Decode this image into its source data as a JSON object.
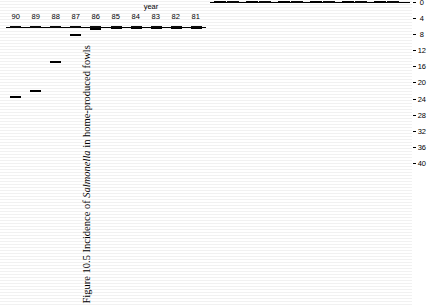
{
  "figure": {
    "caption_prefix": "Figure 10.5 Incidence of ",
    "caption_italic": "Salmonella",
    "caption_suffix": " in home-produced fowls"
  },
  "chart_data": [
    {
      "id": "incidents-by-year",
      "type": "bar",
      "orientation": "horizontal-rotated",
      "title": "",
      "xlabel": "year",
      "ylabel": "incidents",
      "ylim": [
        0,
        2000
      ],
      "yticks": [
        0,
        200,
        400,
        600,
        800,
        1000,
        1200,
        1400,
        1600,
        1800,
        2000
      ],
      "ytick_labels": [
        "0",
        "200",
        "400",
        "600",
        "800",
        "1000",
        "1200",
        "1400",
        "1600",
        "1800",
        "2000"
      ],
      "categories": [
        "77",
        "78",
        "79",
        "80",
        "81",
        "82",
        "83",
        "84",
        "85",
        "86",
        "87",
        "88",
        "89",
        "90"
      ],
      "stacked": true,
      "legend_position": "bottom-left",
      "series": [
        {
          "name": "S. enteritidis",
          "style": "solid",
          "values": [
            0,
            30,
            10,
            10,
            10,
            10,
            10,
            10,
            15,
            20,
            95,
            410,
            750,
            820
          ]
        },
        {
          "name": "Other serotypes",
          "style": "hatch",
          "values": [
            400,
            875,
            1085,
            1455,
            690,
            545,
            500,
            450,
            390,
            420,
            480,
            485,
            790,
            1100
          ]
        }
      ],
      "totals": [
        400,
        905,
        1095,
        1465,
        700,
        555,
        510,
        460,
        405,
        440,
        575,
        895,
        1540,
        1920
      ]
    },
    {
      "id": "percent-contaminated",
      "type": "bar",
      "orientation": "horizontal-rotated",
      "title": "",
      "xlabel": "",
      "ylabel": "% contaminated",
      "ylim": [
        0,
        40
      ],
      "yticks": [
        0,
        4,
        8,
        12,
        16,
        20,
        24,
        28,
        32,
        36,
        40
      ],
      "ytick_labels": [
        "0",
        "4",
        "8",
        "12",
        "16",
        "20",
        "24",
        "28",
        "32",
        "36",
        "40"
      ],
      "categories": [
        "1",
        "2",
        "3",
        "4",
        "5",
        "6"
      ],
      "grouped": true,
      "legend_position": "bottom-left",
      "series": [
        {
          "name": "batches",
          "style": "solid",
          "values": [
            20.0,
            28.0,
            40.0,
            36.0,
            24.0,
            20.0
          ]
        },
        {
          "name": "samples",
          "style": "hatch",
          "values": [
            12.5,
            16.5,
            20.0,
            16.0,
            23.5,
            17.5
          ]
        }
      ]
    }
  ]
}
